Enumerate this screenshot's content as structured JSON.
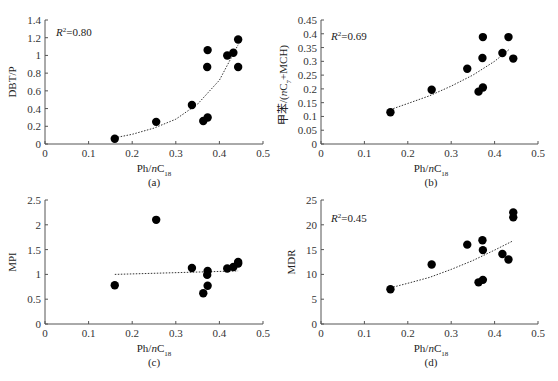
{
  "chart_data": [
    {
      "id": "a",
      "type": "scatter",
      "caption": "(a)",
      "xlabel": "Ph/nC18",
      "ylabel": "DBT/P",
      "xlim": [
        0,
        0.5
      ],
      "ylim": [
        0,
        1.4
      ],
      "xticks": [
        0,
        0.1,
        0.2,
        0.3,
        0.4,
        0.5
      ],
      "yticks": [
        0,
        0.2,
        0.4,
        0.6,
        0.8,
        1,
        1.2,
        1.4
      ],
      "annotation": "R²=0.80",
      "trendline": "exponential",
      "grid": false,
      "points": [
        {
          "x": 0.16,
          "y": 0.06
        },
        {
          "x": 0.255,
          "y": 0.25
        },
        {
          "x": 0.337,
          "y": 0.44
        },
        {
          "x": 0.363,
          "y": 0.26
        },
        {
          "x": 0.373,
          "y": 0.3
        },
        {
          "x": 0.372,
          "y": 0.87
        },
        {
          "x": 0.373,
          "y": 1.06
        },
        {
          "x": 0.418,
          "y": 1.0
        },
        {
          "x": 0.432,
          "y": 1.03
        },
        {
          "x": 0.443,
          "y": 1.18
        },
        {
          "x": 0.443,
          "y": 0.87
        }
      ],
      "trend_points": [
        [
          0.16,
          0.07
        ],
        [
          0.2,
          0.11
        ],
        [
          0.25,
          0.18
        ],
        [
          0.3,
          0.28
        ],
        [
          0.35,
          0.45
        ],
        [
          0.4,
          0.72
        ],
        [
          0.443,
          1.12
        ]
      ]
    },
    {
      "id": "b",
      "type": "scatter",
      "caption": "(b)",
      "xlabel": "Ph/nC18",
      "ylabel": "甲苯/(nC7+MCH)",
      "xlim": [
        0,
        0.5
      ],
      "ylim": [
        0,
        0.45
      ],
      "xticks": [
        0,
        0.1,
        0.2,
        0.3,
        0.4,
        0.5
      ],
      "yticks": [
        0,
        0.05,
        0.1,
        0.15,
        0.2,
        0.25,
        0.3,
        0.35,
        0.4,
        0.45
      ],
      "annotation": "R²=0.69",
      "trendline": "exponential",
      "grid": false,
      "points": [
        {
          "x": 0.16,
          "y": 0.115
        },
        {
          "x": 0.255,
          "y": 0.197
        },
        {
          "x": 0.337,
          "y": 0.273
        },
        {
          "x": 0.363,
          "y": 0.19
        },
        {
          "x": 0.373,
          "y": 0.205
        },
        {
          "x": 0.372,
          "y": 0.312
        },
        {
          "x": 0.373,
          "y": 0.388
        },
        {
          "x": 0.418,
          "y": 0.33
        },
        {
          "x": 0.432,
          "y": 0.388
        },
        {
          "x": 0.443,
          "y": 0.31
        }
      ],
      "trend_points": [
        [
          0.16,
          0.125
        ],
        [
          0.2,
          0.147
        ],
        [
          0.25,
          0.175
        ],
        [
          0.3,
          0.21
        ],
        [
          0.35,
          0.25
        ],
        [
          0.4,
          0.3
        ],
        [
          0.435,
          0.345
        ]
      ]
    },
    {
      "id": "c",
      "type": "scatter",
      "caption": "(c)",
      "xlabel": "Ph/nC18",
      "ylabel": "MPI",
      "xlim": [
        0,
        0.5
      ],
      "ylim": [
        0,
        2.5
      ],
      "xticks": [
        0,
        0.1,
        0.2,
        0.3,
        0.4,
        0.5
      ],
      "yticks": [
        0,
        0.5,
        1,
        1.5,
        2,
        2.5
      ],
      "annotation": "",
      "trendline": "linear",
      "grid": false,
      "points": [
        {
          "x": 0.16,
          "y": 0.78
        },
        {
          "x": 0.255,
          "y": 2.1
        },
        {
          "x": 0.337,
          "y": 1.13
        },
        {
          "x": 0.363,
          "y": 0.62
        },
        {
          "x": 0.373,
          "y": 0.77
        },
        {
          "x": 0.372,
          "y": 0.99
        },
        {
          "x": 0.373,
          "y": 1.07
        },
        {
          "x": 0.418,
          "y": 1.12
        },
        {
          "x": 0.432,
          "y": 1.15
        },
        {
          "x": 0.443,
          "y": 1.22
        },
        {
          "x": 0.443,
          "y": 1.25
        }
      ],
      "trend_points": [
        [
          0.16,
          1.0
        ],
        [
          0.443,
          1.07
        ]
      ]
    },
    {
      "id": "d",
      "type": "scatter",
      "caption": "(d)",
      "xlabel": "Ph/nC18",
      "ylabel": "MDR",
      "xlim": [
        0,
        0.5
      ],
      "ylim": [
        0,
        25
      ],
      "xticks": [
        0,
        0.1,
        0.2,
        0.3,
        0.4,
        0.5
      ],
      "yticks": [
        0,
        5,
        10,
        15,
        20,
        25
      ],
      "annotation": "R²=0.45",
      "trendline": "exponential",
      "grid": false,
      "points": [
        {
          "x": 0.16,
          "y": 7.0
        },
        {
          "x": 0.255,
          "y": 12.0
        },
        {
          "x": 0.337,
          "y": 16.0
        },
        {
          "x": 0.363,
          "y": 8.4
        },
        {
          "x": 0.373,
          "y": 8.9
        },
        {
          "x": 0.372,
          "y": 16.9
        },
        {
          "x": 0.373,
          "y": 14.9
        },
        {
          "x": 0.418,
          "y": 14.1
        },
        {
          "x": 0.432,
          "y": 13.0
        },
        {
          "x": 0.443,
          "y": 21.5
        },
        {
          "x": 0.443,
          "y": 22.5
        }
      ],
      "trend_points": [
        [
          0.16,
          7.3
        ],
        [
          0.2,
          8.2
        ],
        [
          0.25,
          9.4
        ],
        [
          0.3,
          11.0
        ],
        [
          0.35,
          12.8
        ],
        [
          0.4,
          14.9
        ],
        [
          0.443,
          16.8
        ]
      ]
    }
  ],
  "panels": {
    "a": {
      "caption": "(a)",
      "xlabel_main": "Ph/",
      "xlabel_italic": "n",
      "xlabel_c": "C",
      "xlabel_sub": "18",
      "ylabel": "DBT/P",
      "r2_italic": "R",
      "r2_sup": "2",
      "r2_rest": "=0.80"
    },
    "b": {
      "caption": "(b)",
      "xlabel_main": "Ph/",
      "xlabel_italic": "n",
      "xlabel_c": "C",
      "xlabel_sub": "18",
      "ylabel_pre": "甲苯/(",
      "ylabel_italic": "n",
      "ylabel_c": "C",
      "ylabel_sub": "7",
      "ylabel_post": "+MCH)",
      "r2_italic": "R",
      "r2_sup": "2",
      "r2_rest": "=0.69"
    },
    "c": {
      "caption": "(c)",
      "xlabel_main": "Ph/",
      "xlabel_italic": "n",
      "xlabel_c": "C",
      "xlabel_sub": "18",
      "ylabel": "MPI"
    },
    "d": {
      "caption": "(d)",
      "xlabel_main": "Ph/",
      "xlabel_italic": "n",
      "xlabel_c": "C",
      "xlabel_sub": "18",
      "ylabel": "MDR",
      "r2_italic": "R",
      "r2_sup": "2",
      "r2_rest": "=0.45"
    }
  }
}
